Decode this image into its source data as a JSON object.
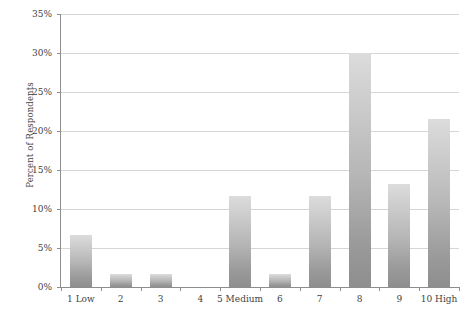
{
  "chart_data": {
    "type": "bar",
    "title": "",
    "xlabel": "",
    "ylabel": "Percent of Respondents",
    "categories": [
      "1 Low",
      "2",
      "3",
      "4",
      "5 Medium",
      "6",
      "7",
      "8",
      "9",
      "10 High"
    ],
    "values": [
      6.7,
      1.7,
      1.7,
      0,
      11.7,
      1.7,
      11.7,
      30.0,
      13.2,
      21.5
    ],
    "value_labels": [
      "6.7%",
      "1.7%",
      "1.7%",
      "0%",
      "11.7%",
      "1.7%",
      "11.7%",
      "30%",
      "13.2%",
      "21.5%"
    ],
    "ylim": [
      0,
      35
    ],
    "ytick_values": [
      0,
      5,
      10,
      15,
      20,
      25,
      30,
      35
    ],
    "ytick_labels": [
      "0%",
      "5%",
      "10%",
      "15%",
      "20%",
      "25%",
      "30%",
      "35%"
    ],
    "grid": true,
    "legend": false,
    "legend_position": "none",
    "bar_color": "#b4b4b4",
    "bar_gradient_top": "#dcdcdc",
    "bar_gradient_bottom": "#8e8e8e",
    "gridline_color": "#d6d6d6",
    "axis_color": "#8d8d8d",
    "text_color": "#3f3f3f",
    "background_color": "#ffffff"
  }
}
